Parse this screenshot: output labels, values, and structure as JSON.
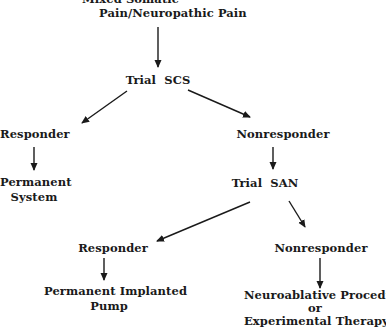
{
  "diagram": {
    "type": "flowchart",
    "nodes": {
      "root": {
        "lines": [
          "Mixed Somatic",
          "Pain/Neuropathic Pain"
        ]
      },
      "trial_scs": {
        "label": "Trial  SCS"
      },
      "scs_responder": {
        "label": "Responder"
      },
      "permanent_system": {
        "lines": [
          "Permanent",
          "System"
        ]
      },
      "scs_nonresponder": {
        "label": "Nonresponder"
      },
      "trial_san": {
        "label": "Trial  SAN"
      },
      "san_responder": {
        "label": "Responder"
      },
      "permanent_pump": {
        "lines": [
          "Permanent Implanted",
          "Pump"
        ]
      },
      "san_nonresponder": {
        "label": "Nonresponder"
      },
      "neuroablative": {
        "lines": [
          "Neuroablative Procedure",
          "or",
          "Experimental Therapy"
        ]
      }
    },
    "edges": [
      {
        "from": "root",
        "to": "trial_scs"
      },
      {
        "from": "trial_scs",
        "to": "scs_responder"
      },
      {
        "from": "trial_scs",
        "to": "scs_nonresponder"
      },
      {
        "from": "scs_responder",
        "to": "permanent_system"
      },
      {
        "from": "scs_nonresponder",
        "to": "trial_san"
      },
      {
        "from": "trial_san",
        "to": "san_responder"
      },
      {
        "from": "trial_san",
        "to": "san_nonresponder"
      },
      {
        "from": "san_responder",
        "to": "permanent_pump"
      },
      {
        "from": "san_nonresponder",
        "to": "neuroablative"
      }
    ],
    "colors": {
      "ink": "#1a1a1a",
      "background": "#ffffff"
    }
  }
}
